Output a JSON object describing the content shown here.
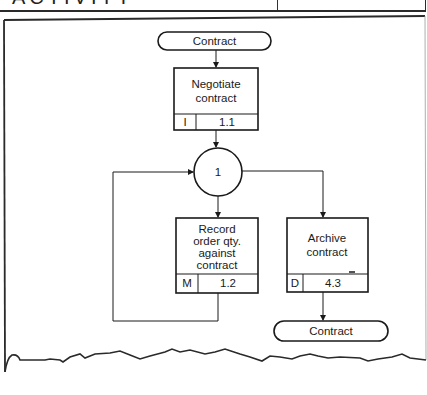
{
  "header": {
    "title_fragment": "ACTIVITY"
  },
  "diagram": {
    "start_terminator": {
      "label": "Contract"
    },
    "end_terminator": {
      "label": "Contract"
    },
    "junction": {
      "label": "1"
    },
    "processes": [
      {
        "id": "negotiate",
        "lines": [
          "Negotiate",
          "contract"
        ],
        "code": "I",
        "number": "1.1"
      },
      {
        "id": "record",
        "lines": [
          "Record",
          "order qty.",
          "against",
          "contract"
        ],
        "code": "M",
        "number": "1.2"
      },
      {
        "id": "archive",
        "lines": [
          "Archive",
          "contract"
        ],
        "code": "D",
        "number": "4.3"
      }
    ]
  },
  "colors": {
    "ink": "#1a1a1a",
    "paper": "#ffffff"
  }
}
